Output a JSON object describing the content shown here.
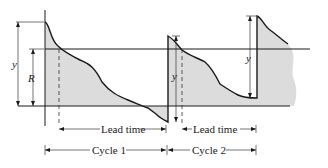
{
  "diagram": {
    "type": "inventory-cycle-diagram",
    "labels": {
      "y_left": "y",
      "R": "R",
      "y_mid": "y",
      "y_right": "y",
      "lead_time_1": "Lead time",
      "lead_time_2": "Lead time",
      "cycle_1": "Cycle 1",
      "cycle_2": "Cycle 2"
    },
    "colors": {
      "fill": "#dcdcdc",
      "line": "#1a1a1a"
    }
  }
}
